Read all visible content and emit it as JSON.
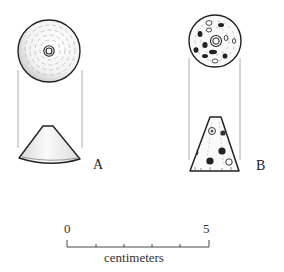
{
  "figure": {
    "objects": [
      {
        "id": "A",
        "label": "A",
        "top_view": "concentric circular striations with central perforation",
        "side_view": "truncated cone"
      },
      {
        "id": "B",
        "label": "B",
        "top_view": "circular face with scattered inclusions and central perforation",
        "side_view": "tall truncated cone (trapezoid) with inclusions"
      }
    ],
    "scale": {
      "start_label": "0",
      "end_label": "5",
      "unit_label": "centimeters",
      "ticks": 6
    }
  },
  "colors": {
    "ink": "#222222",
    "guide": "#9a9a9a",
    "shade": "#bdbdbd",
    "background": "#ffffff"
  }
}
